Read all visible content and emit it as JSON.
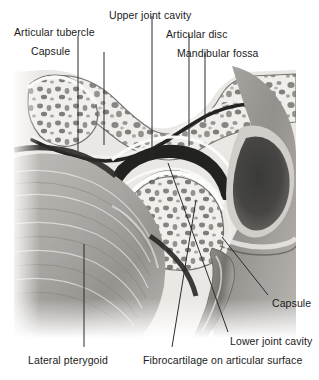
{
  "figure": {
    "kind": "anatomical-illustration",
    "background_color": "#ffffff",
    "label_color": "#1a1a1a",
    "leader_color": "#2b2b2b",
    "photo": {
      "left": 14,
      "top": 66,
      "right": 296,
      "bottom": 338,
      "description": "Grayscale sagittal histological section of the temporomandibular joint"
    }
  },
  "labels": [
    {
      "id": "articular-tubercle",
      "text": "Articular tubercle",
      "x": 14,
      "y": 27,
      "anchor": "start"
    },
    {
      "id": "capsule-left",
      "text": "Capsule",
      "x": 31,
      "y": 46,
      "anchor": "start"
    },
    {
      "id": "upper-joint-cavity",
      "text": "Upper joint cavity",
      "x": 109,
      "y": 10,
      "anchor": "start"
    },
    {
      "id": "articular-disc",
      "text": "Articular disc",
      "x": 166,
      "y": 29,
      "anchor": "start"
    },
    {
      "id": "mandibular-fossa",
      "text": "Mandibular fossa",
      "x": 177,
      "y": 48,
      "anchor": "start"
    },
    {
      "id": "capsule-right",
      "text": "Capsule",
      "x": 272,
      "y": 298,
      "anchor": "start"
    },
    {
      "id": "lower-joint-cavity",
      "text": "Lower joint cavity",
      "x": 230,
      "y": 336,
      "anchor": "start"
    },
    {
      "id": "lateral-pterygoid",
      "text": "Lateral pterygoid",
      "x": 28,
      "y": 355,
      "anchor": "start"
    },
    {
      "id": "fibrocartilage",
      "text": "Fibrocartilage on articular surface",
      "x": 143,
      "y": 355,
      "anchor": "start"
    }
  ],
  "leaders": [
    {
      "id": "leader-articular-tubercle",
      "points": "78,36 78,151"
    },
    {
      "id": "leader-capsule-left",
      "points": "104,52 104,145"
    },
    {
      "id": "leader-upper-joint-cavity",
      "points": "152,16 152,158"
    },
    {
      "id": "leader-articular-disc",
      "points": "189,34 189,146"
    },
    {
      "id": "leader-mandibular-fossa",
      "points": "205,53 205,122"
    },
    {
      "id": "leader-capsule-right",
      "points": "268,295 222,237"
    },
    {
      "id": "leader-lower-joint-cavity",
      "points": "228,332 168,163"
    },
    {
      "id": "leader-lateral-pterygoid",
      "points": "84,347 84,244"
    },
    {
      "id": "leader-fibrocartilage",
      "points": "172,347 196,200"
    }
  ],
  "anatomy_structures": [
    "Articular tubercle",
    "Capsule",
    "Upper joint cavity",
    "Articular disc",
    "Mandibular fossa",
    "Lower joint cavity",
    "Lateral pterygoid",
    "Fibrocartilage on articular surface",
    "Mandibular condyle",
    "External auditory meatus",
    "Styloid process"
  ]
}
